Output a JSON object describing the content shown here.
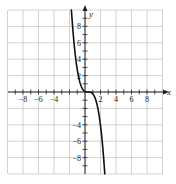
{
  "chart_data": {
    "type": "line",
    "title": "",
    "xlabel": "x",
    "ylabel": "y",
    "xlim": [
      -10,
      10
    ],
    "ylim": [
      -10,
      10
    ],
    "grid": true,
    "grid_step": 2,
    "x_tick_labels": [
      "-8",
      "-6",
      "-4",
      "2",
      "4",
      "6",
      "8"
    ],
    "y_tick_labels": [
      "8",
      "6",
      "4",
      "2",
      "-4",
      "-6",
      "-8"
    ],
    "series": [
      {
        "name": "curve",
        "description": "decreasing cubic with flat inflection near origin",
        "x": [
          -1.8,
          -1.5,
          -1.2,
          -0.9,
          -0.6,
          -0.3,
          0.0,
          0.2,
          0.4,
          0.6,
          0.9,
          1.2,
          1.5,
          1.8,
          2.1,
          2.4,
          2.6
        ],
        "y": [
          10.6,
          7.5,
          4.1,
          2.2,
          1.0,
          0.34,
          0.06,
          0.01,
          0.0,
          -0.01,
          -0.13,
          -0.51,
          -1.33,
          -2.74,
          -4.91,
          -8.0,
          -10.6
        ]
      }
    ],
    "colors": {
      "curve": "#111111",
      "grid": "#c8c8c8",
      "axis": "#222222"
    }
  }
}
